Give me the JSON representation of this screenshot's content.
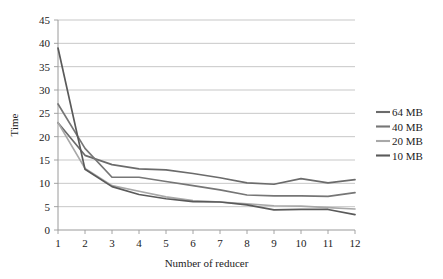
{
  "chart_data": {
    "type": "line",
    "title": "",
    "subtitle": "",
    "xlabel": "Number of reducer",
    "ylabel": "Time",
    "x": [
      1,
      2,
      3,
      4,
      5,
      6,
      7,
      8,
      9,
      10,
      11,
      12
    ],
    "xtick_labels": [
      "1",
      "2",
      "3",
      "4",
      "5",
      "6",
      "7",
      "8",
      "9",
      "10",
      "11",
      "12"
    ],
    "ytick_labels": [
      "0",
      "5",
      "10",
      "15",
      "20",
      "25",
      "30",
      "35",
      "40",
      "45"
    ],
    "ytick_values": [
      0,
      5,
      10,
      15,
      20,
      25,
      30,
      35,
      40,
      45
    ],
    "xlim": [
      1,
      12
    ],
    "ylim": [
      0,
      45
    ],
    "grid": "horizontal",
    "legend_position": "right",
    "series": [
      {
        "name": "64 MB",
        "color": "#6b6b6b",
        "values": [
          23.0,
          16.0,
          14.0,
          13.1,
          12.9,
          12.1,
          11.2,
          10.1,
          9.8,
          11.0,
          10.1,
          10.8
        ]
      },
      {
        "name": "40 MB",
        "color": "#767676",
        "values": [
          27.0,
          17.5,
          11.3,
          11.3,
          10.4,
          9.5,
          8.6,
          7.5,
          7.3,
          7.3,
          7.2,
          8.0
        ]
      },
      {
        "name": "20 MB",
        "color": "#a8a8a8",
        "values": [
          23.0,
          13.2,
          9.5,
          8.3,
          7.1,
          6.3,
          6.0,
          5.6,
          5.2,
          5.1,
          4.8,
          4.5
        ]
      },
      {
        "name": "10 MB",
        "color": "#5a5a5a",
        "values": [
          39.0,
          13.0,
          9.3,
          7.6,
          6.7,
          6.1,
          6.0,
          5.4,
          4.3,
          4.4,
          4.4,
          3.3
        ]
      }
    ]
  },
  "legend": {
    "items": [
      {
        "label": "64 MB",
        "color": "#6b6b6b"
      },
      {
        "label": "40 MB",
        "color": "#767676"
      },
      {
        "label": "20 MB",
        "color": "#a8a8a8"
      },
      {
        "label": "10 MB",
        "color": "#5a5a5a"
      }
    ]
  },
  "axes": {
    "x_title": "Number of reducer",
    "y_title": "Time"
  },
  "style": {
    "grid_color": "#b9b9b9",
    "axis_color": "#9a9a9a",
    "background": "#ffffff",
    "text_color": "#222222"
  }
}
